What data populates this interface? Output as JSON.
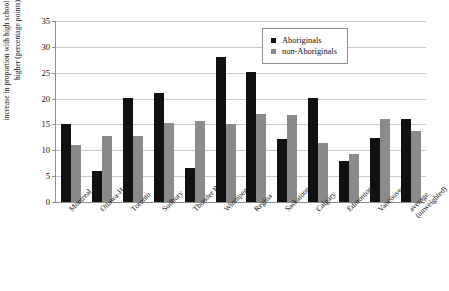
{
  "chart_data": {
    "type": "bar",
    "title": "",
    "xlabel": "",
    "ylabel": "increase in proportion with high school certificate or higher (percentage points)",
    "ylim": [
      0,
      35
    ],
    "yticks": [
      0,
      5,
      10,
      15,
      20,
      25,
      30,
      35
    ],
    "grid": true,
    "legend_position": "top-right",
    "categories": [
      "Montreal",
      "Ottawa-Hull",
      "Toronto",
      "Sudbury",
      "Thunder Bay",
      "Winnipeg",
      "Regina",
      "Saskatoon",
      "Calgary",
      "Edmonton",
      "Vancouver",
      "average (unweighted)"
    ],
    "category_lines": [
      [
        "Montreal"
      ],
      [
        "Ottawa-Hull"
      ],
      [
        "Toronto"
      ],
      [
        "Sudbury"
      ],
      [
        "Thunder Bay"
      ],
      [
        "Winnipeg"
      ],
      [
        "Regina"
      ],
      [
        "Saskatoon"
      ],
      [
        "Calgary"
      ],
      [
        "Edmonton"
      ],
      [
        "Vancouver"
      ],
      [
        "average",
        "(unweighted)"
      ]
    ],
    "series": [
      {
        "name": "Aboriginals",
        "color": "#111111",
        "values": [
          15.0,
          6.0,
          20.1,
          21.0,
          6.5,
          28.0,
          25.1,
          12.1,
          20.2,
          8.0,
          12.3,
          16.0
        ]
      },
      {
        "name": "non-Aboriginals",
        "color": "#8a8a8a",
        "values": [
          11.0,
          12.8,
          12.8,
          15.2,
          15.6,
          15.0,
          17.0,
          16.8,
          11.4,
          9.3,
          16.0,
          13.8
        ]
      }
    ]
  },
  "legend": {
    "items": [
      {
        "label": "Aboriginals",
        "swatch": "black-square-marker"
      },
      {
        "label": "non-Aboriginals",
        "swatch": "gray-square-marker"
      }
    ]
  }
}
